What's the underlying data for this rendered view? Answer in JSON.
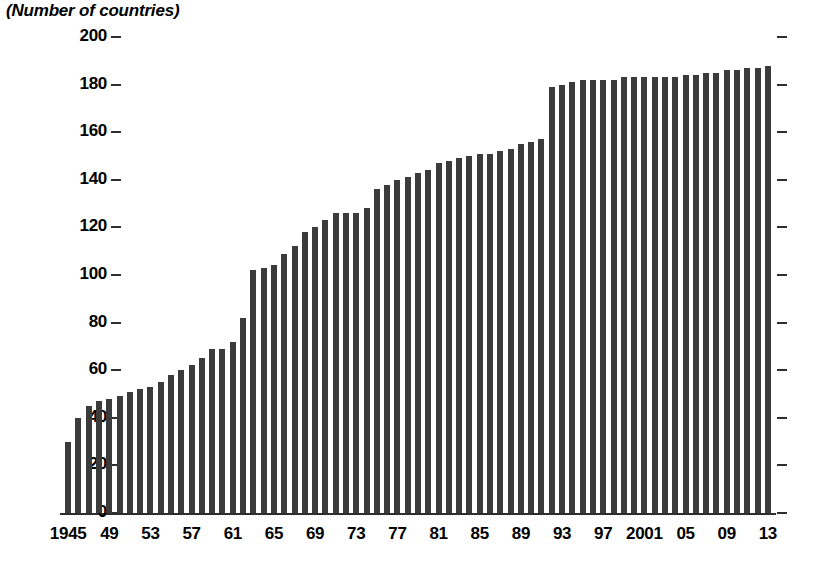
{
  "chart_data": {
    "type": "bar",
    "title": "(Number of countries)",
    "xlabel": "",
    "ylabel": "",
    "ylim": [
      0,
      200
    ],
    "ytick_step": 20,
    "yticks": [
      0,
      20,
      40,
      60,
      80,
      100,
      120,
      140,
      160,
      180,
      200
    ],
    "grid": false,
    "legend": "none",
    "bar_color": "#3b3b3b",
    "axis_color": "#2e2e2e",
    "background": "#ffffff",
    "x": [
      1945,
      1946,
      1947,
      1948,
      1949,
      1950,
      1951,
      1952,
      1953,
      1954,
      1955,
      1956,
      1957,
      1958,
      1959,
      1960,
      1961,
      1962,
      1963,
      1964,
      1965,
      1966,
      1967,
      1968,
      1969,
      1970,
      1971,
      1972,
      1973,
      1974,
      1975,
      1976,
      1977,
      1978,
      1979,
      1980,
      1981,
      1982,
      1983,
      1984,
      1985,
      1986,
      1987,
      1988,
      1989,
      1990,
      1991,
      1992,
      1993,
      1994,
      1995,
      1996,
      1997,
      1998,
      1999,
      2000,
      2001,
      2002,
      2003,
      2004,
      2005,
      2006,
      2007,
      2008,
      2009,
      2010,
      2011,
      2012,
      2013
    ],
    "xtick_labels": [
      "1945",
      "49",
      "53",
      "57",
      "61",
      "65",
      "69",
      "73",
      "77",
      "81",
      "85",
      "89",
      "93",
      "97",
      "2001",
      "05",
      "09",
      "13"
    ],
    "xtick_years": [
      1945,
      1949,
      1953,
      1957,
      1961,
      1965,
      1969,
      1973,
      1977,
      1981,
      1985,
      1989,
      1993,
      1997,
      2001,
      2005,
      2009,
      2013
    ],
    "values": [
      30,
      40,
      45,
      47,
      48,
      49,
      51,
      52,
      53,
      55,
      58,
      60,
      62,
      65,
      69,
      69,
      72,
      82,
      102,
      103,
      104,
      109,
      112,
      118,
      120,
      123,
      126,
      126,
      126,
      128,
      136,
      138,
      140,
      141,
      143,
      144,
      147,
      148,
      149,
      150,
      151,
      151,
      152,
      153,
      155,
      156,
      157,
      179,
      180,
      181,
      182,
      182,
      182,
      182,
      183,
      183,
      183,
      183,
      183,
      183,
      184,
      184,
      185,
      185,
      186,
      186,
      187,
      187,
      188
    ]
  }
}
